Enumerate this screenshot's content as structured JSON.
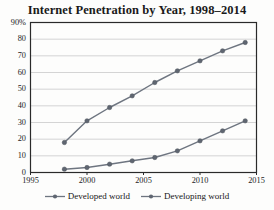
{
  "chart_data": {
    "type": "line",
    "title": "Internet Penetration by Year, 1998–2014",
    "xlabel": "",
    "ylabel": "",
    "x": [
      1998,
      2000,
      2002,
      2004,
      2006,
      2008,
      2010,
      2012,
      2014
    ],
    "xlim": [
      1995,
      2015
    ],
    "ylim": [
      0,
      90
    ],
    "xticks": [
      1995,
      2000,
      2005,
      2010,
      2015
    ],
    "xtick_labels": [
      "1995",
      "2000",
      "2005",
      "2010",
      "2015"
    ],
    "yticks": [
      0,
      10,
      20,
      30,
      40,
      50,
      60,
      70,
      80,
      90
    ],
    "ytick_labels": [
      "0",
      "10",
      "20",
      "30",
      "40",
      "50",
      "60",
      "70",
      "80",
      "90%"
    ],
    "grid": "horizontal",
    "legend_position": "bottom",
    "series": [
      {
        "name": "Developed world",
        "values": [
          18,
          31,
          39,
          46,
          54,
          61,
          67,
          73,
          78
        ],
        "color": "#6e7580",
        "marker": "circle"
      },
      {
        "name": "Developing world",
        "values": [
          2,
          3,
          5,
          7,
          9,
          13,
          19,
          25,
          31
        ],
        "color": "#6e7580",
        "marker": "circle"
      }
    ]
  },
  "legend": {
    "entries": [
      {
        "label": "Developed world",
        "symbol": "line-marker-symbol"
      },
      {
        "label": "Developing world",
        "symbol": "line-marker-symbol"
      }
    ]
  },
  "colors": {
    "series_line": "#6e7580",
    "plot_border": "#2a2a2a",
    "gridline": "#c9c9c9",
    "text": "#1a1a1a",
    "background": "#fdfdfc"
  }
}
